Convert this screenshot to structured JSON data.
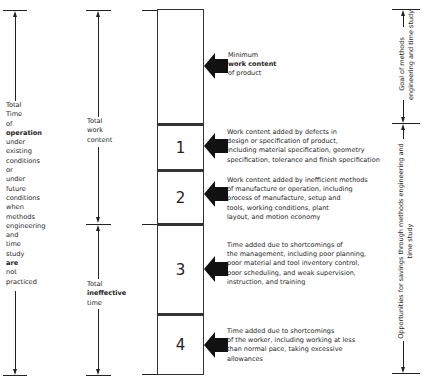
{
  "diagram": {
    "left_column": {
      "label_lines": [
        "Total",
        "Time",
        "of",
        "operation",
        "under",
        "existing",
        "conditions",
        "or",
        "under",
        "future",
        "conditions",
        "when",
        "methods",
        "engineering",
        "and",
        "time",
        "study",
        "are",
        "not",
        "practiced"
      ]
    },
    "middle_column": {
      "total_work_content": [
        "Total",
        "work",
        "content"
      ],
      "total_ineffective_time": [
        "Total",
        "ineffective",
        "time"
      ]
    },
    "blocks": [
      {
        "number": "",
        "description": [
          "Minimum",
          "work content",
          "of product"
        ]
      },
      {
        "number": "1",
        "description": [
          "Work content added by defects in",
          "design or specification of product,",
          "including material specification, geometry",
          "specification, tolerance and finish specification"
        ]
      },
      {
        "number": "2",
        "description": [
          "Work content added by inefficient methods",
          "of manufacture or operation, including",
          "process of manufacture, setup and",
          "tools, working conditions, plant",
          "layout, and motion economy"
        ]
      },
      {
        "number": "3",
        "description": [
          "Time added due to shortcomings of",
          "the management, including poor planning,",
          "poor material and tool inventory control,",
          "poor scheduling, and weak supervision,",
          "instruction, and training"
        ]
      },
      {
        "number": "4",
        "description": [
          "Time added due to shortcomings",
          "of the worker, including working at less",
          "than normal pace, taking excessive",
          "allowances"
        ]
      }
    ],
    "right_column": {
      "goal_label": [
        "Goal of methods",
        "engineering and time study"
      ],
      "opportunities_label": [
        "Opportunities for savings through methods engineering and",
        "time study"
      ]
    },
    "colors": {
      "line": "#222222",
      "text": "#1e1e1e",
      "background": "#ffffff",
      "arrow_fill": "#111111"
    }
  }
}
